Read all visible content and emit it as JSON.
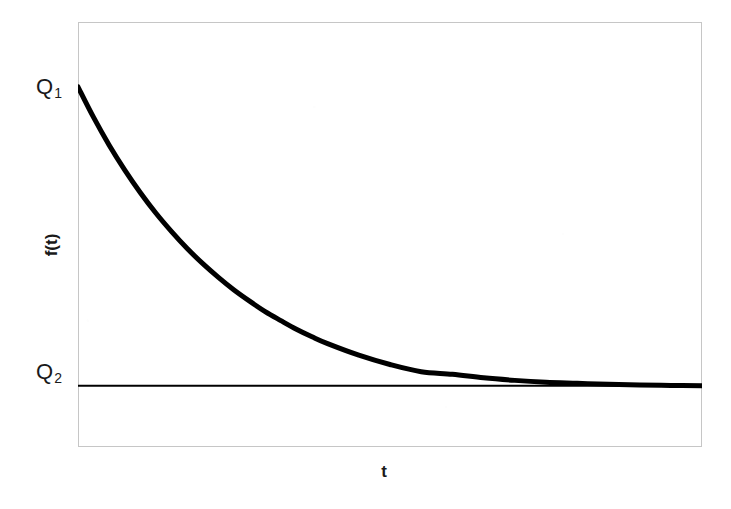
{
  "chart_data": {
    "type": "line",
    "title": "",
    "subtitle": "",
    "xlabel": "t",
    "ylabel": "f(t)",
    "grid": false,
    "legend": null,
    "xlim": [
      0,
      10
    ],
    "ylim": [
      0,
      1.18
    ],
    "annotations": [
      {
        "text": "Q₁",
        "base": "Q",
        "sub": "1",
        "value": 1.0,
        "axis": "y",
        "role": "initial-value-tick"
      },
      {
        "text": "Q₂",
        "base": "Q",
        "sub": "2",
        "value": 0.17,
        "axis": "y",
        "role": "asymptote-value-tick"
      }
    ],
    "series": [
      {
        "name": "f(t)",
        "style": "solid",
        "color": "#000000",
        "line_width": 5,
        "description": "exponential decay from Q1 approaching asymptote Q2",
        "x": [
          0.0,
          0.25,
          0.5,
          0.75,
          1.0,
          1.25,
          1.5,
          1.75,
          2.0,
          2.25,
          2.5,
          2.75,
          3.0,
          3.25,
          3.5,
          3.75,
          4.0,
          4.5,
          5.0,
          5.5,
          6.0,
          6.5,
          7.0,
          7.5,
          8.0,
          8.5,
          9.0,
          9.5,
          10.0
        ],
        "y": [
          1.0,
          0.915,
          0.838,
          0.769,
          0.706,
          0.649,
          0.598,
          0.551,
          0.509,
          0.471,
          0.436,
          0.405,
          0.376,
          0.351,
          0.327,
          0.306,
          0.287,
          0.255,
          0.229,
          0.209,
          0.202,
          0.192,
          0.185,
          0.18,
          0.177,
          0.174,
          0.172,
          0.171,
          0.17
        ]
      },
      {
        "name": "Q2 asymptote",
        "style": "solid",
        "color": "#000000",
        "line_width": 2,
        "description": "horizontal asymptote line at Q2",
        "x": [
          0.0,
          10.0
        ],
        "y": [
          0.17,
          0.17
        ]
      }
    ]
  },
  "figure": {
    "background_color": "#ffffff",
    "frame_color": "#c6c6c6",
    "curve_color": "#000000",
    "label_color": "#1a1a1a"
  }
}
